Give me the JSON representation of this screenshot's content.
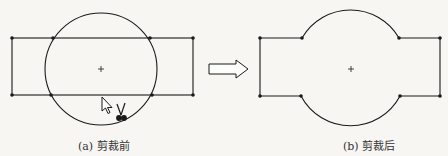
{
  "captions": {
    "before": "(a) 剪裁前",
    "after": "(b) 剪裁后"
  },
  "colors": {
    "line": "#1a1a1a",
    "background": "#f7f6f3"
  },
  "icons": {
    "cursor": "arrow-cursor-icon",
    "scissors": "scissors-icon",
    "arrow": "right-arrow-icon",
    "center": "center-plus-icon"
  }
}
